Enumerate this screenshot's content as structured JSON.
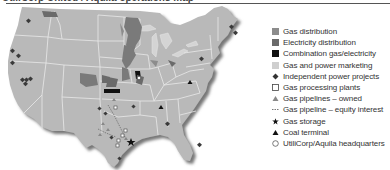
{
  "header": {
    "title": "UtiliCorp United / Aquila operations map"
  },
  "colors": {
    "land": "#b9b9b9",
    "border": "#e6e6e6",
    "shadow": "#8a8a8a",
    "gas_distribution": "#8c8c8c",
    "electricity_distribution": "#6a6a6a",
    "combination": "#111111",
    "marketing": "#cfcfcf",
    "marker": "#3a3a3a"
  },
  "legend": {
    "items": [
      {
        "key": "gas_distribution",
        "label": "Gas distribution",
        "symbol": "square-medium-gray"
      },
      {
        "key": "electricity_distribution",
        "label": "Electricity distribution",
        "symbol": "square-dark-gray"
      },
      {
        "key": "combination",
        "label": "Combination gas/electricity",
        "symbol": "square-black"
      },
      {
        "key": "marketing",
        "label": "Gas and power marketing",
        "symbol": "square-light-gray"
      },
      {
        "key": "ipp",
        "label": "Independent power projects",
        "symbol": "diamond-dark"
      },
      {
        "key": "processing",
        "label": "Gas processing plants",
        "symbol": "square-outline"
      },
      {
        "key": "pipelines_owned",
        "label": "Gas pipelines – owned",
        "symbol": "triangle-gray"
      },
      {
        "key": "pipeline_equity",
        "label": "Gas pipeline – equity interest",
        "symbol": "dashed-line"
      },
      {
        "key": "storage",
        "label": "Gas storage",
        "symbol": "star-black"
      },
      {
        "key": "coal",
        "label": "Coal terminal",
        "symbol": "triangle-black"
      },
      {
        "key": "hq",
        "label": "UtiliCorp/Aquila headquarters",
        "symbol": "circle-outline"
      }
    ]
  },
  "map": {
    "region": "Contiguous United States",
    "markers": {
      "ipp": [
        [
          29,
          16
        ],
        [
          13,
          46
        ],
        [
          19,
          51
        ],
        [
          13,
          58
        ],
        [
          23,
          75
        ],
        [
          27,
          75
        ],
        [
          30,
          74
        ],
        [
          25,
          79
        ],
        [
          98,
          149
        ],
        [
          52,
          112
        ],
        [
          52,
          151
        ],
        [
          216,
          25
        ],
        [
          222,
          31
        ],
        [
          233,
          63
        ],
        [
          199,
          137
        ],
        [
          170,
          122
        ],
        [
          183,
          146
        ]
      ],
      "processing": [
        [
          114,
          104
        ],
        [
          127,
          140
        ],
        [
          118,
          149
        ],
        [
          116,
          144
        ],
        [
          128,
          133
        ]
      ],
      "pipelines_owned": [
        [
          113,
          95
        ],
        [
          106,
          119
        ],
        [
          108,
          125
        ],
        [
          115,
          143
        ],
        [
          100,
          130
        ],
        [
          122,
          140
        ]
      ],
      "storage": [
        [
          128,
          148
        ]
      ],
      "coal": [
        [
          189,
          84
        ],
        [
          210,
          73
        ]
      ],
      "hq": [
        [
          139,
          80
        ]
      ]
    }
  }
}
